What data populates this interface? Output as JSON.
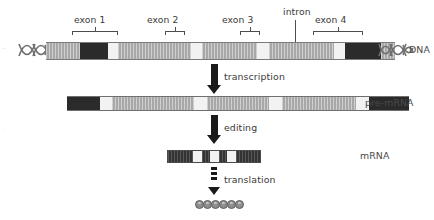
{
  "diagram": {
    "labels": {
      "exon1": "exon 1",
      "exon2": "exon 2",
      "exon3": "exon 3",
      "exon4": "exon 4",
      "intron": "intron",
      "dna": "DNA",
      "pre_mrna": "pre-mRNA",
      "mrna": "mRNA",
      "transcription": "transcription",
      "editing": "editing",
      "translation": "translation"
    },
    "colors": {
      "exon_dark": "#2b2b2b",
      "intron_mid": "#a8a8a8",
      "spacer_light": "#f2f2f2",
      "outline": "#4d4d4d",
      "arrow": "#1a1a1a",
      "amino_acid": "#8e8e8e",
      "background": "#ffffff",
      "text": "#3a3a3a"
    },
    "rows": [
      {
        "name": "dna",
        "label": "DNA",
        "has_helix_ends": true,
        "segments": [
          {
            "kind": "mid",
            "width": 38
          },
          {
            "kind": "dark",
            "width": 32
          },
          {
            "kind": "light",
            "width": 12
          },
          {
            "kind": "mid",
            "width": 82
          },
          {
            "kind": "light",
            "width": 13
          },
          {
            "kind": "mid",
            "width": 62
          },
          {
            "kind": "light",
            "width": 13
          },
          {
            "kind": "mid",
            "width": 74
          },
          {
            "kind": "light",
            "width": 13
          },
          {
            "kind": "dark",
            "width": 40
          },
          {
            "kind": "mid",
            "width": 16
          }
        ]
      },
      {
        "name": "pre-mrna",
        "label": "pre-mRNA",
        "has_helix_ends": false,
        "segments": [
          {
            "kind": "dark",
            "width": 33
          },
          {
            "kind": "light",
            "width": 12
          },
          {
            "kind": "mid",
            "width": 82
          },
          {
            "kind": "light",
            "width": 13
          },
          {
            "kind": "mid",
            "width": 62
          },
          {
            "kind": "light",
            "width": 13
          },
          {
            "kind": "mid",
            "width": 74
          },
          {
            "kind": "light",
            "width": 13
          },
          {
            "kind": "dark",
            "width": 40
          }
        ]
      },
      {
        "name": "mrna",
        "label": "mRNA",
        "has_helix_ends": false,
        "segments": [
          {
            "kind": "dark",
            "width": 25
          },
          {
            "kind": "light",
            "width": 9
          },
          {
            "kind": "dark",
            "width": 8
          },
          {
            "kind": "light",
            "width": 9
          },
          {
            "kind": "dark",
            "width": 8
          },
          {
            "kind": "light",
            "width": 9
          },
          {
            "kind": "dark",
            "width": 24
          }
        ]
      }
    ],
    "brackets": [
      {
        "label_key": "exon1",
        "left": 72,
        "width": 46,
        "label_x": 74,
        "label_y": 16
      },
      {
        "label_key": "exon2",
        "left": 165,
        "width": 20,
        "label_x": 148,
        "label_y": 16
      },
      {
        "label_key": "exon3",
        "left": 240,
        "width": 20,
        "label_x": 223,
        "label_y": 16
      },
      {
        "label_key": "exon4",
        "left": 313,
        "width": 50,
        "label_x": 315,
        "label_y": 16
      }
    ],
    "intron_pointer": {
      "x": 295,
      "top": 22,
      "height": 24,
      "label_x": 283,
      "label_y": 9
    },
    "steps": [
      {
        "key": "transcription",
        "label": "transcription",
        "label_x": 224,
        "label_y": 72
      },
      {
        "key": "editing",
        "label": "editing",
        "label_x": 224,
        "label_y": 123
      },
      {
        "key": "translation",
        "label": "translation",
        "label_x": 224,
        "label_y": 175
      }
    ],
    "protein": {
      "residue_count": 6,
      "x": 195,
      "y": 200
    }
  }
}
